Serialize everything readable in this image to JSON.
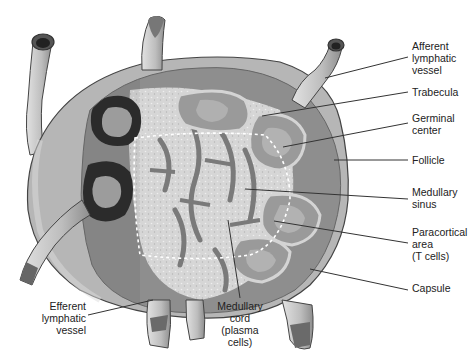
{
  "diagram": {
    "colors": {
      "background": "#ffffff",
      "capsule": "#b8b8b8",
      "capsule_outline": "#444444",
      "cortex": "#9a9a9a",
      "follicle_dark": "#2e2e2e",
      "germinal_center": "#a8a8a8",
      "medulla_light": "#d8d8d8",
      "medulla_dark": "#8a8a8a",
      "vessel": "#c8c8c8",
      "leader_line": "#333333"
    },
    "labels": [
      {
        "id": "afferent",
        "text": "Afferent\nlymphatic\nvessel"
      },
      {
        "id": "trabecula",
        "text": "Trabecula"
      },
      {
        "id": "germinal",
        "text": "Germinal\ncenter"
      },
      {
        "id": "follicle",
        "text": "Follicle"
      },
      {
        "id": "medsinus",
        "text": "Medullary\nsinus"
      },
      {
        "id": "paracortical",
        "text": "Paracortical\narea\n(T cells)"
      },
      {
        "id": "capsule",
        "text": "Capsule"
      },
      {
        "id": "efferent",
        "text": "Efferent\nlymphatic\nvessel"
      },
      {
        "id": "medcord",
        "text": "Medullary\ncord\n(plasma\ncells)"
      }
    ]
  }
}
